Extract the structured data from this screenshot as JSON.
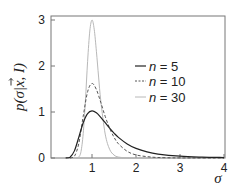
{
  "chart_data": {
    "type": "line",
    "title": "",
    "xlabel": "σ",
    "ylabel": "p(σ|x⃗, I)",
    "xlim": [
      0.07,
      4
    ],
    "ylim": [
      0,
      3.1
    ],
    "xticks": [
      1,
      2,
      3,
      4
    ],
    "xtick_labels": [
      "1",
      "2",
      "3",
      "4"
    ],
    "yticks": [
      0,
      1,
      2,
      3
    ],
    "ytick_labels": [
      "0",
      "1",
      "2",
      "3"
    ],
    "grid": false,
    "legend_position": "right-center inside",
    "series": [
      {
        "name": "n = 5",
        "legend_label": "n =  5",
        "n_label": "n",
        "value_label": "=  5",
        "style": "solid",
        "color": "#222222",
        "width": 1.2,
        "x": [
          0.4,
          0.5,
          0.6,
          0.7,
          0.8,
          0.9,
          1.0,
          1.1,
          1.2,
          1.3,
          1.4,
          1.5,
          1.6,
          1.8,
          2.0,
          2.25,
          2.5,
          3.0,
          3.5,
          4.0
        ],
        "y": [
          0.0,
          0.018,
          0.155,
          0.452,
          0.768,
          0.967,
          1.026,
          0.983,
          0.885,
          0.767,
          0.649,
          0.542,
          0.449,
          0.306,
          0.209,
          0.132,
          0.086,
          0.039,
          0.019,
          0.01
        ]
      },
      {
        "name": "n = 10",
        "legend_label": "n = 10",
        "n_label": "n",
        "value_label": "= 10",
        "style": "dashed",
        "color": "#555555",
        "width": 1.0,
        "x": [
          0.5,
          0.6,
          0.7,
          0.8,
          0.9,
          1.0,
          1.1,
          1.2,
          1.3,
          1.4,
          1.5,
          1.6,
          1.8,
          2.0,
          2.25,
          2.5,
          3.0,
          4.0
        ],
        "y": [
          0.0,
          0.037,
          0.316,
          0.906,
          1.44,
          1.62,
          1.488,
          1.206,
          0.904,
          0.649,
          0.452,
          0.31,
          0.145,
          0.067,
          0.03,
          0.011,
          0.002,
          0.0
        ]
      },
      {
        "name": "n = 30",
        "legend_label": "n = 30",
        "n_label": "n",
        "value_label": "= 30",
        "style": "solid",
        "color": "#b8b8b8",
        "width": 1.0,
        "x": [
          0.65,
          0.7,
          0.75,
          0.8,
          0.85,
          0.9,
          0.95,
          1.0,
          1.05,
          1.1,
          1.15,
          1.2,
          1.3,
          1.4,
          1.5,
          1.6,
          1.8,
          2.0,
          3.0,
          4.0
        ],
        "y": [
          0.0,
          0.02,
          0.14,
          0.53,
          1.24,
          2.1,
          2.76,
          3.0,
          2.8,
          2.32,
          1.76,
          1.24,
          0.52,
          0.19,
          0.065,
          0.021,
          0.002,
          0.0,
          0.0,
          0.0
        ]
      }
    ]
  },
  "axes": {
    "y_label_main": "p(σ|",
    "y_label_vec": "x",
    "y_label_rest": ", I)",
    "x_label": "σ"
  }
}
